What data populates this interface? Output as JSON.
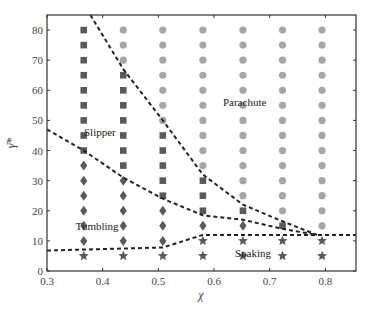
{
  "chart_data": {
    "type": "scatter",
    "title": "",
    "xlabel": "χ",
    "ylabel": "γ̄*",
    "xlim": [
      0.3,
      0.855
    ],
    "ylim": [
      0,
      85
    ],
    "xticks": [
      0.3,
      0.4,
      0.5,
      0.6,
      0.7,
      0.8
    ],
    "xtick_labels": [
      "0.3",
      "0.4",
      "0.5",
      "0.6",
      "0.7",
      "0.8"
    ],
    "yticks": [
      0,
      10,
      20,
      30,
      40,
      50,
      60,
      70,
      80
    ],
    "ytick_labels": [
      "0",
      "10",
      "20",
      "30",
      "40",
      "50",
      "60",
      "70",
      "80"
    ],
    "grid": false,
    "legend": null,
    "regions": [
      {
        "label": "Slipper",
        "x": 0.395,
        "y": 46
      },
      {
        "label": "Parachute",
        "x": 0.655,
        "y": 56
      },
      {
        "label": "Tumbling",
        "x": 0.39,
        "y": 15
      },
      {
        "label": "Snaking",
        "x": 0.67,
        "y": 6
      }
    ],
    "series": [
      {
        "name": "Parachute",
        "marker": "circle",
        "color": "#a6a6a6",
        "points": [
          [
            0.437,
            80
          ],
          [
            0.437,
            75
          ],
          [
            0.437,
            70
          ],
          [
            0.508,
            80
          ],
          [
            0.508,
            75
          ],
          [
            0.508,
            70
          ],
          [
            0.508,
            65
          ],
          [
            0.508,
            60
          ],
          [
            0.508,
            55
          ],
          [
            0.508,
            50
          ],
          [
            0.58,
            80
          ],
          [
            0.58,
            75
          ],
          [
            0.58,
            70
          ],
          [
            0.58,
            65
          ],
          [
            0.58,
            60
          ],
          [
            0.58,
            55
          ],
          [
            0.58,
            50
          ],
          [
            0.58,
            45
          ],
          [
            0.58,
            40
          ],
          [
            0.58,
            35
          ],
          [
            0.652,
            80
          ],
          [
            0.652,
            75
          ],
          [
            0.652,
            70
          ],
          [
            0.652,
            65
          ],
          [
            0.652,
            60
          ],
          [
            0.652,
            55
          ],
          [
            0.652,
            50
          ],
          [
            0.652,
            45
          ],
          [
            0.652,
            40
          ],
          [
            0.652,
            35
          ],
          [
            0.652,
            30
          ],
          [
            0.652,
            25
          ],
          [
            0.723,
            80
          ],
          [
            0.723,
            75
          ],
          [
            0.723,
            70
          ],
          [
            0.723,
            65
          ],
          [
            0.723,
            60
          ],
          [
            0.723,
            55
          ],
          [
            0.723,
            50
          ],
          [
            0.723,
            45
          ],
          [
            0.723,
            40
          ],
          [
            0.723,
            35
          ],
          [
            0.723,
            30
          ],
          [
            0.723,
            25
          ],
          [
            0.723,
            20
          ],
          [
            0.794,
            80
          ],
          [
            0.794,
            75
          ],
          [
            0.794,
            70
          ],
          [
            0.794,
            65
          ],
          [
            0.794,
            60
          ],
          [
            0.794,
            55
          ],
          [
            0.794,
            50
          ],
          [
            0.794,
            45
          ],
          [
            0.794,
            40
          ],
          [
            0.794,
            35
          ],
          [
            0.794,
            30
          ],
          [
            0.794,
            25
          ],
          [
            0.794,
            20
          ],
          [
            0.794,
            15
          ]
        ]
      },
      {
        "name": "Slipper",
        "marker": "square",
        "color": "#5a5a5a",
        "points": [
          [
            0.366,
            80
          ],
          [
            0.366,
            75
          ],
          [
            0.366,
            70
          ],
          [
            0.366,
            65
          ],
          [
            0.366,
            60
          ],
          [
            0.366,
            55
          ],
          [
            0.366,
            50
          ],
          [
            0.366,
            45
          ],
          [
            0.366,
            40
          ],
          [
            0.437,
            65
          ],
          [
            0.437,
            60
          ],
          [
            0.437,
            55
          ],
          [
            0.437,
            50
          ],
          [
            0.437,
            45
          ],
          [
            0.437,
            40
          ],
          [
            0.437,
            35
          ],
          [
            0.508,
            45
          ],
          [
            0.508,
            40
          ],
          [
            0.508,
            35
          ],
          [
            0.508,
            30
          ],
          [
            0.508,
            25
          ],
          [
            0.58,
            30
          ],
          [
            0.58,
            25
          ],
          [
            0.58,
            20
          ],
          [
            0.652,
            20
          ],
          [
            0.723,
            15
          ]
        ]
      },
      {
        "name": "Tumbling",
        "marker": "diamond",
        "color": "#5a5a5a",
        "points": [
          [
            0.366,
            35
          ],
          [
            0.366,
            30
          ],
          [
            0.366,
            25
          ],
          [
            0.366,
            20
          ],
          [
            0.366,
            15
          ],
          [
            0.366,
            10
          ],
          [
            0.437,
            30
          ],
          [
            0.437,
            25
          ],
          [
            0.437,
            20
          ],
          [
            0.437,
            15
          ],
          [
            0.437,
            10
          ],
          [
            0.508,
            20
          ],
          [
            0.508,
            15
          ],
          [
            0.508,
            10
          ],
          [
            0.58,
            15
          ],
          [
            0.652,
            15
          ]
        ]
      },
      {
        "name": "Snaking",
        "marker": "star",
        "color": "#5a5a5a",
        "points": [
          [
            0.366,
            5
          ],
          [
            0.437,
            5
          ],
          [
            0.508,
            5
          ],
          [
            0.58,
            10
          ],
          [
            0.58,
            5
          ],
          [
            0.652,
            10
          ],
          [
            0.652,
            5
          ],
          [
            0.723,
            10
          ],
          [
            0.723,
            5
          ],
          [
            0.794,
            10
          ],
          [
            0.794,
            5
          ]
        ]
      }
    ],
    "boundaries": [
      {
        "name": "slipper-parachute",
        "style": "dashed",
        "color": "#222222",
        "points": [
          [
            0.378,
            85
          ],
          [
            0.437,
            67
          ],
          [
            0.508,
            50
          ],
          [
            0.58,
            32
          ],
          [
            0.652,
            22
          ],
          [
            0.723,
            16.5
          ],
          [
            0.785,
            12
          ]
        ]
      },
      {
        "name": "slipper-tumbling",
        "style": "dashed",
        "color": "#222222",
        "points": [
          [
            0.3,
            47
          ],
          [
            0.366,
            40
          ],
          [
            0.437,
            31
          ],
          [
            0.508,
            24
          ],
          [
            0.58,
            18.5
          ],
          [
            0.652,
            17
          ],
          [
            0.723,
            14
          ],
          [
            0.785,
            12
          ]
        ]
      },
      {
        "name": "tumbling-snaking",
        "style": "dashed",
        "color": "#222222",
        "points": [
          [
            0.3,
            6.8
          ],
          [
            0.508,
            7.8
          ],
          [
            0.58,
            12
          ],
          [
            0.855,
            12
          ]
        ]
      }
    ]
  }
}
